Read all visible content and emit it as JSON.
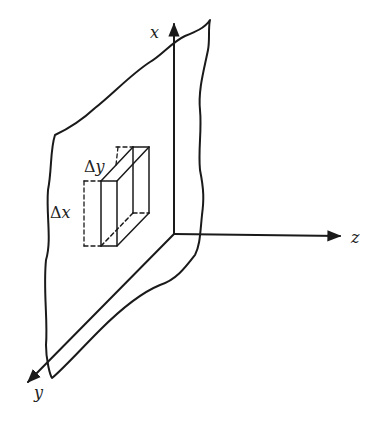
{
  "diagram": {
    "type": "3d-coordinate-sketch",
    "axes": {
      "x": {
        "label": "x"
      },
      "y": {
        "label": "y"
      },
      "z": {
        "label": "z"
      }
    },
    "element_labels": {
      "dy": {
        "symbol": "Δ",
        "var": "y"
      },
      "dx": {
        "symbol": "Δ",
        "var": "x"
      }
    },
    "colors": {
      "ink": "#1a1a1a",
      "background": "#ffffff"
    }
  }
}
